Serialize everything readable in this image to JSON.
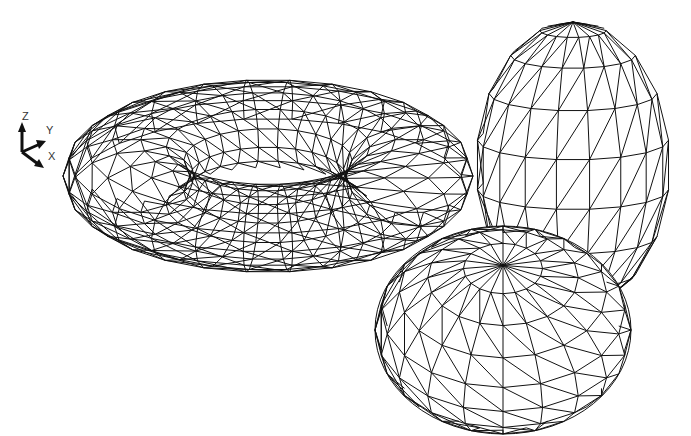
{
  "viewport": {
    "background": "#ffffff",
    "line_color": "#111111"
  },
  "ucs_icon": {
    "z_label": "Z",
    "y_label": "Y",
    "x_label": "X"
  },
  "objects": [
    {
      "name": "torus",
      "center": [
        268,
        176
      ],
      "rx": 205,
      "ry": 138,
      "hole_rx": 105,
      "hole_ry": 42
    },
    {
      "name": "ellipsoid",
      "center": [
        573,
        165
      ],
      "rx": 97,
      "ry": 143
    },
    {
      "name": "sphere",
      "center": [
        503,
        330
      ],
      "rx": 128,
      "ry": 104
    }
  ]
}
